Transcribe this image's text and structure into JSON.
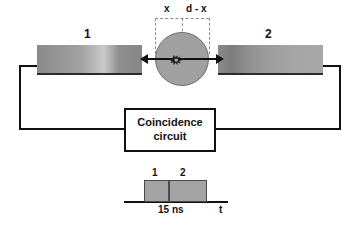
{
  "diagram": {
    "detectors": [
      {
        "id": "detector-1",
        "label": "1"
      },
      {
        "id": "detector-2",
        "label": "2"
      }
    ],
    "source": {
      "icon": "burst-star-icon",
      "circle_fill": "#a0a0a0"
    },
    "distance_bracket": {
      "left_segment_label": "x",
      "right_segment_label": "d - x"
    },
    "circuit_box": {
      "line_1": "Coincidence",
      "line_2": "circuit"
    },
    "pulse_diagram": {
      "pulse_1_label": "1",
      "pulse_2_label": "2",
      "duration_label": "15 ns",
      "time_axis_label": "t"
    },
    "colors": {
      "line": "#111111",
      "detector_gray": "#9a9a9a",
      "source_gray": "#a0a0a0",
      "pulse_gray": "#a3a3a3",
      "dashed_gray": "#8f8f8f"
    }
  }
}
